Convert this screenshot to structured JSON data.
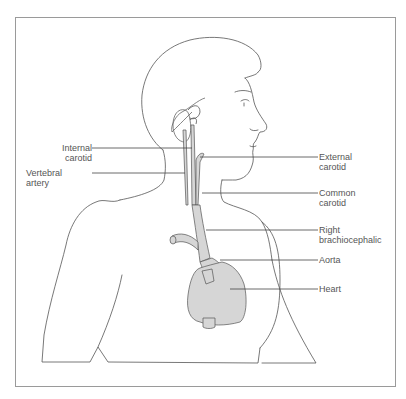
{
  "diagram": {
    "labels_left": [
      {
        "id": "internal-carotid",
        "line1": "Internal",
        "line2": "carotid"
      },
      {
        "id": "vertebral-artery",
        "line1": "Vertebral",
        "line2": "artery"
      }
    ],
    "labels_right": [
      {
        "id": "external-carotid",
        "line1": "External",
        "line2": "carotid"
      },
      {
        "id": "common-carotid",
        "line1": "Common",
        "line2": "carotid"
      },
      {
        "id": "right-brachiocephalic",
        "line1": "Right",
        "line2": "brachiocephalic"
      },
      {
        "id": "aorta",
        "line1": "Aorta",
        "line2": ""
      },
      {
        "id": "heart",
        "line1": "Heart",
        "line2": ""
      }
    ],
    "colors": {
      "outline": "#555555",
      "vessel_fill": "#d6d6d6",
      "frame": "#9a9a9a",
      "leader": "#444444"
    }
  }
}
